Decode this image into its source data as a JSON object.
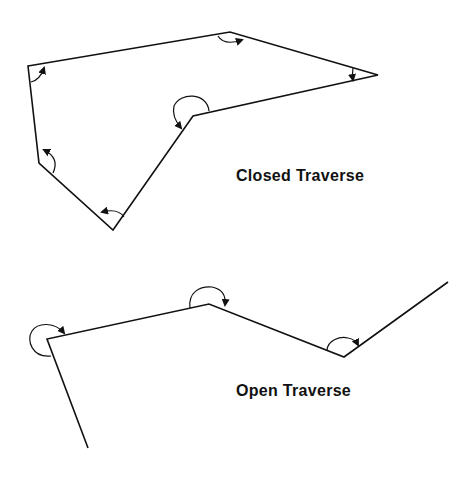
{
  "diagram": {
    "closed_traverse": {
      "label": "Closed Traverse",
      "vertices": [
        [
          28,
          66
        ],
        [
          230,
          32
        ],
        [
          378,
          75
        ],
        [
          193,
          116
        ],
        [
          113,
          230
        ],
        [
          39,
          163
        ]
      ]
    },
    "open_traverse": {
      "label": "Open Traverse",
      "vertices": [
        [
          88,
          448
        ],
        [
          47,
          339
        ],
        [
          209,
          304
        ],
        [
          344,
          357
        ],
        [
          448,
          282
        ]
      ]
    },
    "colors": {
      "line": "#111111",
      "background": "#ffffff"
    }
  }
}
